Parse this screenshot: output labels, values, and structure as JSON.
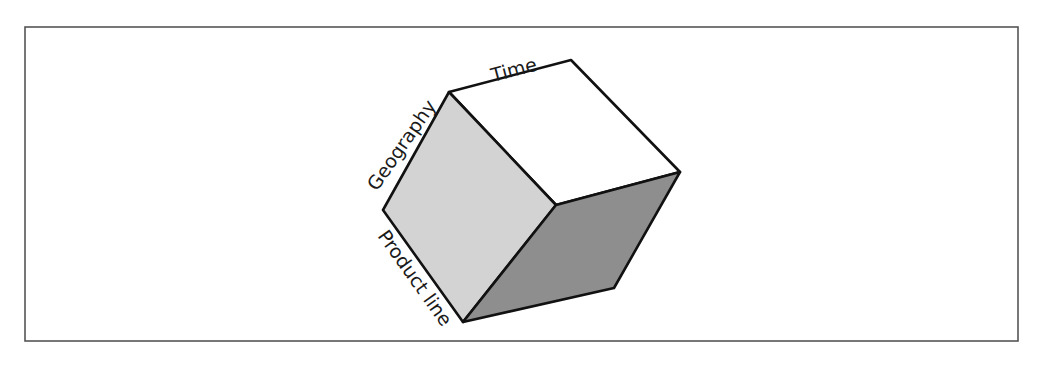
{
  "diagram": {
    "type": "olap-cube",
    "axes": {
      "top": "Time",
      "left": "Geography",
      "bottom": "Product line"
    },
    "colors": {
      "frame": "#555555",
      "top_face": "#ffffff",
      "left_face": "#d3d3d3",
      "right_face": "#8e8e8e",
      "edge": "#111111"
    }
  }
}
